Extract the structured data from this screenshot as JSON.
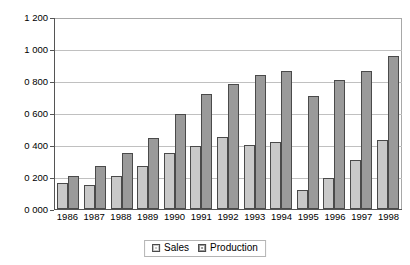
{
  "chart_data": {
    "type": "bar",
    "title": "",
    "subtitle": "",
    "xlabel": "",
    "ylabel": "",
    "categories": [
      "1986",
      "1987",
      "1988",
      "1989",
      "1990",
      "1991",
      "1992",
      "1993",
      "1994",
      "1995",
      "1996",
      "1997",
      "1998"
    ],
    "series": [
      {
        "name": "Sales",
        "color": "#c9c9c9",
        "values": [
          160,
          150,
          205,
          270,
          350,
          395,
          450,
          400,
          420,
          120,
          195,
          305,
          430
        ]
      },
      {
        "name": "Production",
        "color": "#9a9a9a",
        "values": [
          205,
          270,
          350,
          445,
          595,
          720,
          780,
          835,
          865,
          705,
          805,
          860,
          955
        ]
      }
    ],
    "ylim": [
      0,
      1200
    ],
    "ytick_values": [
      0,
      200,
      400,
      600,
      800,
      1000,
      1200
    ],
    "ytick_labels": [
      "0 000",
      "0 200",
      "0 400",
      "0 600",
      "0 800",
      "1 000",
      "1 200"
    ],
    "grid": true,
    "grid_axis": "y",
    "legend_position": "bottom",
    "legend_entries": [
      "Sales",
      "Production"
    ]
  }
}
